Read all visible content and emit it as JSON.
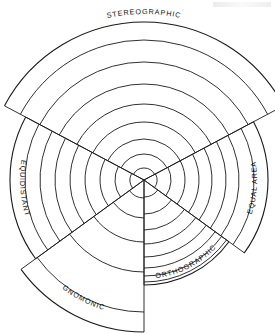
{
  "figure": {
    "center": {
      "x": 144,
      "y": 180
    },
    "stroke_color": "#1a1a1a",
    "background_color": "#ffffff"
  },
  "chart_data": {
    "type": "line",
    "xlabel": "",
    "ylabel": "",
    "grid": false,
    "legend_position": "around-perimeter",
    "coordinate_system": "polar",
    "center": {
      "x": 144,
      "y": 180
    },
    "angle_unit": "degrees",
    "angles_measured_from": "vertical-up, clockwise positive",
    "unit_radius_px": 95,
    "series": [
      {
        "name": "STEREOGRAPHIC",
        "label": "STEREOGRAPHIC",
        "formula": "r = 2 tan(theta/2)",
        "start_angle": -62,
        "end_angle": 62,
        "outer_radius": 158,
        "ring_count": 9,
        "radii": [
          12,
          26,
          41,
          58,
          76,
          96,
          118,
          140,
          158
        ],
        "label_radius": 166,
        "label_angle": 0
      },
      {
        "name": "EQUIDISTANT",
        "label": "EQUIDISTANT",
        "formula": "r = theta",
        "start_angle": -126,
        "end_angle": -62,
        "outer_radius": 134,
        "ring_count": 9,
        "radii": [
          14,
          29,
          44,
          59,
          74,
          89,
          104,
          119,
          134
        ],
        "label_radius": 124,
        "label_angle": -96
      },
      {
        "name": "EQUAL AREA",
        "label": "EQUAL AREA",
        "formula": "r = 2 sin(theta/2)",
        "start_angle": 62,
        "end_angle": 126,
        "outer_radius": 124,
        "ring_count": 9,
        "radii": [
          13,
          27,
          41,
          55,
          68,
          82,
          95,
          110,
          124
        ],
        "label_radius": 113,
        "label_angle": 96
      },
      {
        "name": "ORTHOGRAPHIC",
        "label": "ORTHOGRAPHIC",
        "formula": "r = sin(theta)",
        "start_angle": 126,
        "end_angle": 180,
        "outer_radius": 105,
        "ring_count": 9,
        "radii": [
          17,
          34,
          50,
          64,
          77,
          88,
          96,
          102,
          105
        ],
        "label_radius": 99,
        "label_angle": 150
      },
      {
        "name": "GNOMONIC",
        "label": "GNOMONIC",
        "formula": "r = tan(theta)",
        "start_angle": -180,
        "end_angle": -126,
        "outer_radius": 152,
        "ring_count": 6,
        "radii": [
          18,
          38,
          62,
          92,
          132,
          152
        ],
        "label_radius": 136,
        "label_angle": -154
      }
    ]
  },
  "labels": {
    "stereographic": "STEREOGRAPHIC",
    "equidistant": "EQUIDISTANT",
    "equal_area": "EQUAL AREA",
    "orthographic": "ORTHOGRAPHIC",
    "gnomonic": "GNOMONIC"
  }
}
